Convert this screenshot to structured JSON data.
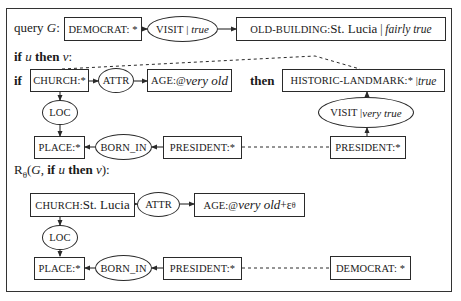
{
  "section_query": {
    "label_prefix": "query ",
    "label_var": "G",
    "label_suffix": ":",
    "nodes": {
      "democrat": "DEMOCRAT: *",
      "visit_rel": "VISIT",
      "visit_truth": "true",
      "old_building_concept": "OLD-BUILDING: ",
      "old_building_ref": "St. Lucia",
      "old_building_truth": "fairly true"
    }
  },
  "section_rule": {
    "heading_if": "if",
    "heading_u": "u",
    "heading_then": "then",
    "heading_v": "v",
    "heading_colon": ":",
    "if_label": "if",
    "then_label": "then",
    "nodes": {
      "church": "CHURCH:*",
      "attr": "ATTR",
      "age_prefix": "AGE:@",
      "age_value": "very old",
      "historic_landmark": "HISTORIC-LANDMARK:* | ",
      "historic_truth": "true",
      "loc": "LOC",
      "visit_rel": "VISIT | ",
      "visit_truth": "very true",
      "place": "PLACE:*",
      "born_in": "BORN_IN",
      "president_left": "PRESIDENT:*",
      "president_right": "PRESIDENT:*"
    }
  },
  "section_result": {
    "heading_R": "R",
    "heading_theta": "θ",
    "heading_open": "(",
    "heading_G": "G",
    "heading_comma": ", ",
    "heading_if": "if",
    "heading_u": "u",
    "heading_then": "then",
    "heading_v": "v",
    "heading_close": "):",
    "nodes": {
      "church_concept": "CHURCH: ",
      "church_ref": "St. Lucia",
      "attr": "ATTR",
      "age_prefix": "AGE:@",
      "age_value": "very old",
      "age_plus": "+ε",
      "age_sub": "θ",
      "loc": "LOC",
      "place": "PLACE:*",
      "born_in": "BORN_IN",
      "president": "PRESIDENT:*",
      "democrat": "DEMOCRAT: *"
    }
  }
}
